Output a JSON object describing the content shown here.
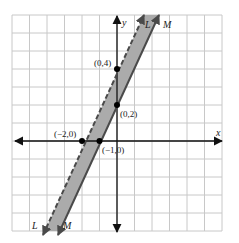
{
  "graph": {
    "x_axis_label": "x",
    "y_axis_label": "y",
    "grid": {
      "x_min": -6,
      "x_max": 6,
      "y_min": -5,
      "y_max": 7
    },
    "colors": {
      "band": "#ababab",
      "line": "#4a4a4a",
      "grid": "#c8c8c8",
      "axis": "#111111",
      "point": "#000000"
    },
    "lines": [
      {
        "name": "L",
        "style": "dashed",
        "equation": "y = 2x + 4",
        "top_label": "L",
        "bottom_label": "L"
      },
      {
        "name": "M",
        "style": "solid",
        "equation": "y = 2x + 2",
        "top_label": "M",
        "bottom_label": "M"
      }
    ],
    "points": [
      {
        "label": "(0,4)",
        "x": 0,
        "y": 4
      },
      {
        "label": "(0,2)",
        "x": 0,
        "y": 2
      },
      {
        "label": "(−2,0)",
        "x": -2,
        "y": 0
      },
      {
        "label": "(−1,0)",
        "x": -1,
        "y": 0
      }
    ]
  }
}
